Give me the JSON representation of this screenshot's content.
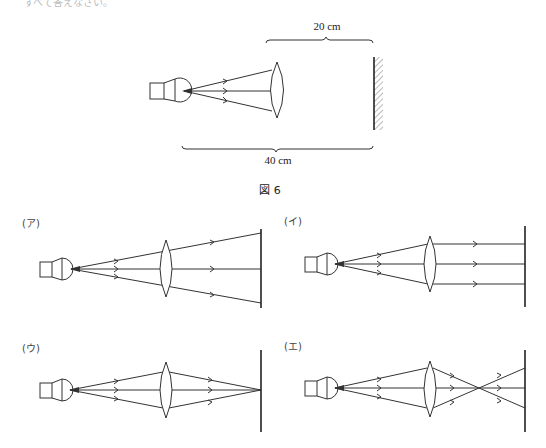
{
  "header": {
    "partial_text": "すべて答えなさい。"
  },
  "figure": {
    "caption": "図 6",
    "dimension_top": "20 cm",
    "dimension_bottom": "40 cm",
    "components": [
      "light-bulb",
      "convex-lens",
      "screen-wall"
    ]
  },
  "options": [
    {
      "label": "(ア)",
      "description": "rays diverge after lens"
    },
    {
      "label": "(イ)",
      "description": "rays parallel after lens"
    },
    {
      "label": "(ウ)",
      "description": "rays converge on screen"
    },
    {
      "label": "(エ)",
      "description": "rays cross before screen"
    }
  ],
  "colors": {
    "line": "#333333",
    "hatch": "#555555",
    "background": "#ffffff"
  }
}
